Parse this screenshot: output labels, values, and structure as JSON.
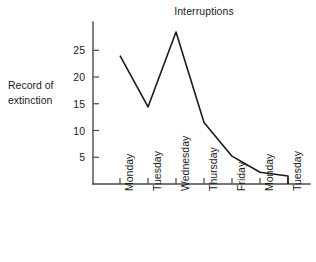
{
  "chart_data": {
    "type": "line",
    "title": "Interruptions",
    "xlabel": "",
    "ylabel": "Record of extinction",
    "ylabel_line1": "Record of",
    "ylabel_line2": "extinction",
    "categories": [
      "Monday",
      "Tuesday",
      "Wednesday",
      "Thursday",
      "Friday",
      "Monday",
      "Tuesday"
    ],
    "values": [
      24,
      14.4,
      28.4,
      11.5,
      5.2,
      2.2,
      1.5
    ],
    "end_drop_value": 0,
    "yticks": [
      5,
      10,
      15,
      20,
      25
    ],
    "ylim": [
      0,
      30
    ],
    "xlim": [
      0,
      7
    ],
    "grid": false,
    "legend": false,
    "series": [
      {
        "name": "Record of extinction",
        "values": [
          24,
          14.4,
          28.4,
          11.5,
          5.2,
          2.2,
          1.5
        ]
      }
    ],
    "line_color": "#1a1a1a",
    "axis_color": "#4a4a4a",
    "background_color": "#ffffff"
  },
  "geometry": {
    "axis_x": 93,
    "axis_top": 22,
    "baseline_y": 184,
    "axis_right": 310,
    "px_per_unit": 5.35,
    "tick_xs": [
      120,
      148,
      176,
      204,
      232,
      260,
      288
    ]
  }
}
